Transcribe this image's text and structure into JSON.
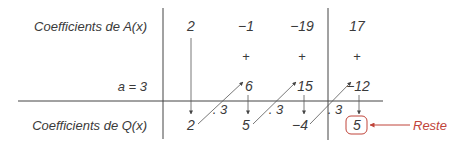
{
  "labels": {
    "row_a": "Coefficients de A(x)",
    "row_a_value": "a = 3",
    "row_q": "Coefficients de Q(x)",
    "reste": "Reste"
  },
  "rows": {
    "A_coefficients": [
      "2",
      "−1",
      "−19",
      "17"
    ],
    "plus_signs": [
      "+",
      "+",
      "+"
    ],
    "products": [
      "6",
      "15",
      "−12"
    ],
    "Q_coefficients": [
      "2",
      "5",
      "−4"
    ],
    "remainder": "5",
    "multipliers": [
      ". 3",
      ". 3",
      ". 3"
    ]
  },
  "colors": {
    "text": "#3a3a3a",
    "line": "#444444",
    "arrow": "#555555",
    "accent": "#c0443a"
  }
}
